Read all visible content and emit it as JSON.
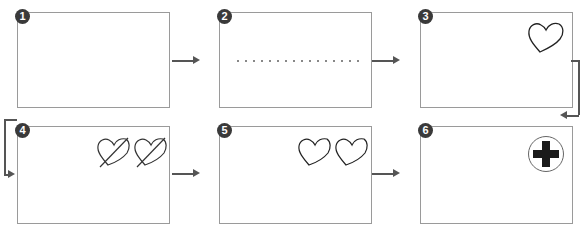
{
  "diagram": {
    "type": "step-sequence",
    "steps": [
      {
        "number": "1",
        "content": "empty panel"
      },
      {
        "number": "2",
        "content": "dotted line"
      },
      {
        "number": "3",
        "content": "single heart outline"
      },
      {
        "number": "4",
        "content": "two hearts crossed out"
      },
      {
        "number": "5",
        "content": "two heart outlines"
      },
      {
        "number": "6",
        "content": "black cross inside circle"
      }
    ],
    "flow": [
      "1->2",
      "2->3",
      "3->6",
      "6<-3 (row wrap)",
      "4->5",
      "5->6"
    ],
    "colors": {
      "border": "#9a9a9a",
      "badge": "#3a3a3a",
      "arrow": "#555555",
      "stroke": "#222222"
    }
  }
}
